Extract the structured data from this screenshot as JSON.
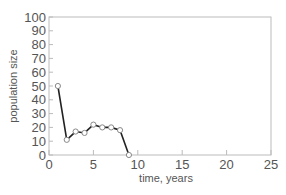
{
  "chart_data": {
    "type": "line",
    "title": "",
    "xlabel": "time, years",
    "ylabel": "population size",
    "xlim": [
      0,
      25
    ],
    "ylim": [
      0,
      100
    ],
    "x_ticks": [
      "0",
      "5",
      "10",
      "15",
      "20",
      "25"
    ],
    "y_ticks": [
      "0",
      "10",
      "20",
      "30",
      "40",
      "50",
      "60",
      "70",
      "80",
      "90",
      "100"
    ],
    "grid": false,
    "legend": null,
    "series": [
      {
        "name": "population",
        "x": [
          1,
          2,
          3,
          4,
          5,
          6,
          7,
          8,
          9
        ],
        "values": [
          50,
          11,
          17,
          16,
          22,
          20,
          20,
          18,
          0
        ],
        "marker": "open-circle",
        "color": "#222222"
      }
    ]
  }
}
